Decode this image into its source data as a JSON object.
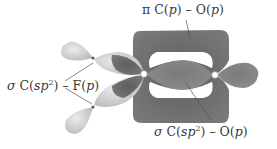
{
  "diagram": {
    "type": "molecular-orbital-illustration",
    "labels": {
      "pi_bond": {
        "prefix": "π",
        "atom1": "C",
        "orb1": "p",
        "sep": " – ",
        "atom2": "O",
        "orb2": "p"
      },
      "sigma_co": {
        "prefix": "σ",
        "atom1": "C",
        "orb1": "sp",
        "orb1_sup": "2",
        "sep": " – ",
        "atom2": "O",
        "orb2": "p"
      },
      "sigma_cf": {
        "prefix": "σ",
        "atom1": "C",
        "orb1": "sp",
        "orb1_sup": "2",
        "sep": " – ",
        "atom2": "F",
        "orb2": "p"
      }
    },
    "colors": {
      "dark_lobe": "#6e6e6e",
      "medium_lobe": "#8a8a8a",
      "light_lobe": "#d2d2d2",
      "text": "#3a3a3a",
      "leader_line": "#555555"
    }
  }
}
